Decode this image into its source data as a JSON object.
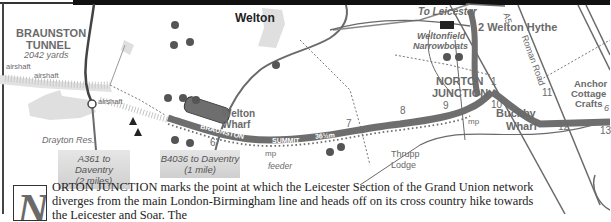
{
  "map": {
    "places": {
      "braunston_tunnel": "BRAUNSTON",
      "braunston_tunnel_2": "TUNNEL",
      "tunnel_length": "2042 yards",
      "welton": "Welton",
      "welton_wharf_1": "Welton",
      "welton_wharf_2": "Wharf",
      "drayton_res": "Drayton Res.",
      "thrupp_lodge_1": "Thrupp",
      "thrupp_lodge_2": "Lodge",
      "norton_junction_1": "NORTON",
      "norton_junction_2": "JUNCTION",
      "buckby_wharf_1": "Buckby",
      "buckby_wharf_2": "Wharf",
      "welton_hythe": "2 Welton Hythe",
      "weltonfield_1": "Weltonfield",
      "weltonfield_2": "Narrowboats",
      "anchor_1": "Anchor",
      "anchor_2": "Cottage",
      "anchor_3": "Crafts",
      "to_leicester": "To Leicester"
    },
    "features": {
      "airshaft_1": "airshaft",
      "airshaft_2": "airshaft",
      "airshaft_3": "airshaft",
      "mp_1": "mp",
      "mp_2": "mp",
      "feeder": "feeder",
      "road_a5": "A5",
      "roman_road": "Roman Road"
    },
    "canal_labels": {
      "braunston": "BRAUNSTON",
      "summit": "SUMMIT",
      "pound": "36½m"
    },
    "numbers": [
      "1",
      "6",
      "7",
      "8",
      "9",
      "10",
      "11",
      "12",
      "13",
      "6"
    ],
    "signs": {
      "a361_line1": "A361 to Daventry",
      "a361_line2": "(2 miles)",
      "b4036_line1": "B4036 to Daventry",
      "b4036_line2": "(1 mile)"
    },
    "colors": {
      "canal": "#6e6e6e",
      "road": "#6a6a6a",
      "label": "#6a6a6a",
      "shade": "#d6d6d6"
    }
  },
  "text": {
    "dropcap": "N",
    "line1": "ORTON JUNCTION marks the point at which the Leicester Section of the Grand Union network",
    "line2": "diverges from the main London-Birmingham line and heads off on its cross country hike towards",
    "line3": "the Leicester and Soar. The"
  }
}
